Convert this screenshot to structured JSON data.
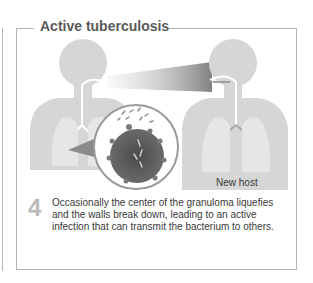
{
  "panel": {
    "title": "Active tuberculosis",
    "label_new_host": "New host",
    "step": {
      "number": "4",
      "text": "Occasionally the center of the granuloma liquefies and the walls break down, leading to an active infection that can transmit the bacterium to others."
    }
  },
  "colors": {
    "body_fill": "#d6d6d6",
    "frame": "#b4b4b4",
    "title": "#5a5a5a",
    "granuloma": "#5e5e5e",
    "step_number": "#b9b9b9"
  },
  "figures": [
    {
      "name": "infected-host",
      "side": "left"
    },
    {
      "name": "new-host",
      "side": "right"
    }
  ]
}
